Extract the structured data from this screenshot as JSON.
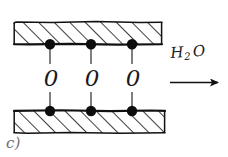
{
  "figure": {
    "label": "c)",
    "caption_letter": "c)",
    "reagent_formula": {
      "element_1": "H",
      "subscript": "2",
      "element_2": "O",
      "full": "H2O"
    },
    "bridge_symbol": "0",
    "bridge_symbols": [
      "0",
      "0",
      "0"
    ],
    "colors": {
      "ink": "#111111",
      "hatch": "#1a1a1a",
      "label": "#6f6f6f",
      "background": "#ffffff"
    },
    "geometry": {
      "top_plate": {
        "x": 14,
        "y": 22,
        "width": 148,
        "height": 22
      },
      "bottom_plate": {
        "x": 14,
        "y": 110,
        "width": 151,
        "height": 23
      },
      "node_x_positions": [
        50,
        91,
        132
      ],
      "top_node_y": 44,
      "bottom_node_y": 111,
      "node_radius": 5,
      "bridge_label_y": 78,
      "arrow": {
        "x1": 170,
        "x2": 224,
        "y": 82
      }
    }
  }
}
